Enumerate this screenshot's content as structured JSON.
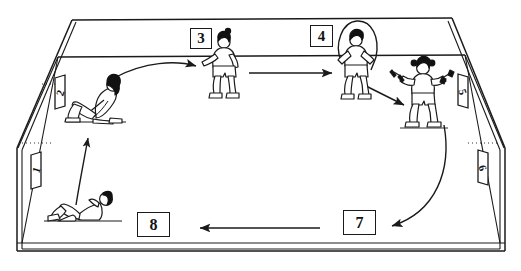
{
  "diagram": {
    "type": "perspective-room-line-drawing",
    "ink_color": "#1a1a1a",
    "background_color": "#ffffff"
  },
  "stations": {
    "floor_boxes": [
      {
        "id": "box-3",
        "label": "3"
      },
      {
        "id": "box-4",
        "label": "4"
      },
      {
        "id": "box-7",
        "label": "7"
      },
      {
        "id": "box-8",
        "label": "8"
      }
    ],
    "wall_markers": [
      {
        "id": "marker-1",
        "label": "1",
        "wall": "left-lower"
      },
      {
        "id": "marker-2",
        "label": "2",
        "wall": "left-upper"
      },
      {
        "id": "marker-5",
        "label": "5",
        "wall": "right-upper"
      },
      {
        "id": "marker-6",
        "label": "6",
        "wall": "right-lower"
      }
    ]
  },
  "figures": [
    {
      "id": "figure-situp-seated",
      "activity": "seated sit-up / curl-up, legs bent"
    },
    {
      "id": "figure-lying-supine",
      "activity": "lying supine, knees bent, hands behind head"
    },
    {
      "id": "figure-standing",
      "activity": "standing, arm extended forward"
    },
    {
      "id": "figure-jump-rope",
      "activity": "jumping rope"
    },
    {
      "id": "figure-dumbbells",
      "activity": "standing with dumbbells raised"
    }
  ],
  "arrows": [
    {
      "id": "arrow-seated-to-standing",
      "shape": "curved",
      "direction": "right"
    },
    {
      "id": "arrow-standing-to-rope",
      "shape": "straight",
      "direction": "right"
    },
    {
      "id": "arrow-rope-to-dumbbells",
      "shape": "straight",
      "direction": "down-right"
    },
    {
      "id": "arrow-dumbbells-to-box7",
      "shape": "long-curve",
      "direction": "down-left"
    },
    {
      "id": "arrow-box7-to-box8",
      "shape": "straight",
      "direction": "left"
    },
    {
      "id": "arrow-lying-to-seated",
      "shape": "slight-curve",
      "direction": "up"
    }
  ]
}
